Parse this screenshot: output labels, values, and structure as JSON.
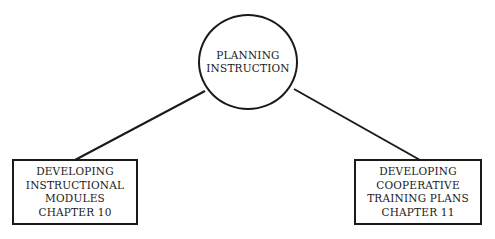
{
  "diagram": {
    "root": {
      "lines": [
        "PLANNING",
        "INSTRUCTION"
      ]
    },
    "children": [
      {
        "lines": [
          "DEVELOPING",
          "INSTRUCTIONAL",
          "MODULES",
          "CHAPTER 10"
        ]
      },
      {
        "lines": [
          "DEVELOPING",
          "COOPERATIVE",
          "TRAINING PLANS",
          "CHAPTER 11"
        ]
      }
    ],
    "colors": {
      "stroke": "#1a1a1a",
      "background": "#ffffff"
    }
  }
}
